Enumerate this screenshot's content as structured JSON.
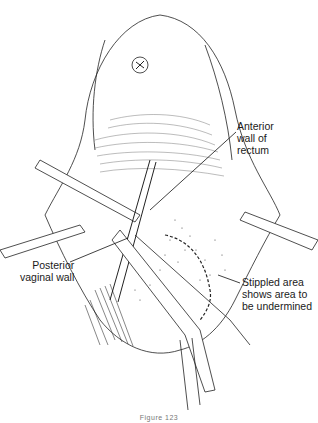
{
  "figure": {
    "type": "surgical line illustration",
    "labels": {
      "anterior_wall": [
        "Anterior",
        "wall of",
        "rectum"
      ],
      "posterior_vaginal": [
        "Posterior",
        "vaginal wall"
      ],
      "stippled": [
        "Stippled area",
        "shows area to",
        "be undermined"
      ]
    },
    "caption": "Figure 123"
  }
}
